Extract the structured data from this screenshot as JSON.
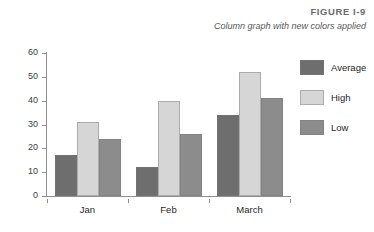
{
  "figure": {
    "label": "FIGURE I-9",
    "caption": "Column graph with new colors applied"
  },
  "colors": {
    "average": "#6e6e6e",
    "high": "#d6d6d6",
    "low": "#8c8c8c",
    "axis": "#8f8f8f",
    "text": "#1f1f1f",
    "header_text": "#6b6b6b"
  },
  "chart_data": {
    "type": "bar",
    "title": "Column graph with new colors applied",
    "xlabel": "",
    "ylabel": "",
    "ylim": [
      0,
      60
    ],
    "yticks": [
      0,
      10,
      20,
      30,
      40,
      50,
      60
    ],
    "grid": false,
    "legend_position": "right",
    "categories": [
      "Jan",
      "Feb",
      "March"
    ],
    "series": [
      {
        "name": "Average",
        "color": "#6e6e6e",
        "values": [
          17,
          12,
          34
        ]
      },
      {
        "name": "High",
        "color": "#d6d6d6",
        "values": [
          31,
          40,
          52
        ]
      },
      {
        "name": "Low",
        "color": "#8c8c8c",
        "values": [
          24,
          26,
          41
        ]
      }
    ]
  }
}
